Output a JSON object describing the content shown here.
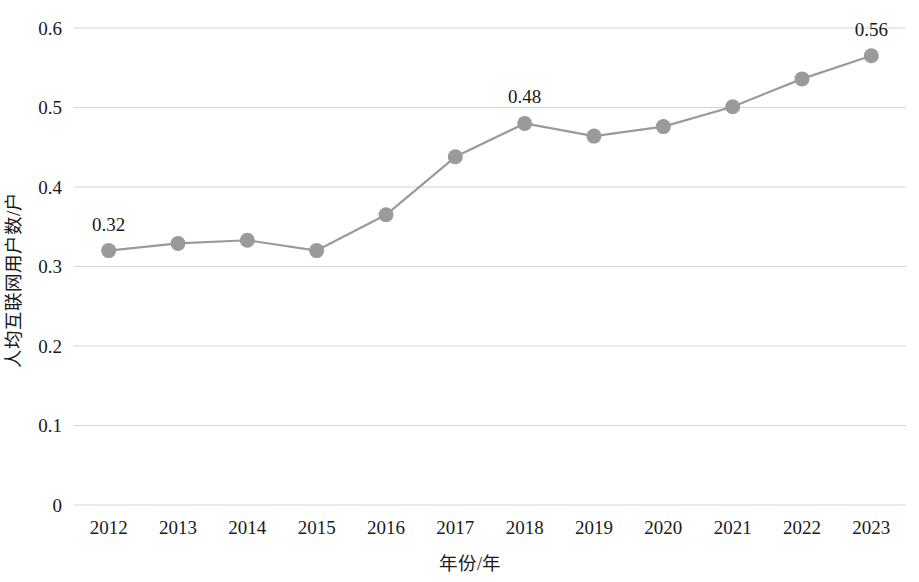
{
  "chart_data": {
    "type": "line",
    "title": "",
    "xlabel": "年份/年",
    "ylabel": "人均互联网用户数/户",
    "categories": [
      "2012",
      "2013",
      "2014",
      "2015",
      "2016",
      "2017",
      "2018",
      "2019",
      "2020",
      "2021",
      "2022",
      "2023"
    ],
    "values": [
      0.32,
      0.329,
      0.333,
      0.32,
      0.365,
      0.438,
      0.48,
      0.464,
      0.476,
      0.501,
      0.536,
      0.565
    ],
    "series": [
      {
        "name": "人均互联网用户数",
        "values": [
          0.32,
          0.329,
          0.333,
          0.32,
          0.365,
          0.438,
          0.48,
          0.464,
          0.476,
          0.501,
          0.536,
          0.565
        ]
      }
    ],
    "point_labels": [
      {
        "index": 0,
        "text": "0.32"
      },
      {
        "index": 6,
        "text": "0.48"
      },
      {
        "index": 11,
        "text": "0.56"
      }
    ],
    "ylim": [
      0,
      0.6
    ],
    "yticks": [
      0,
      0.1,
      0.2,
      0.3,
      0.4,
      0.5,
      0.6
    ],
    "ytick_labels": [
      "0",
      "0.1",
      "0.2",
      "0.3",
      "0.4",
      "0.5",
      "0.6"
    ],
    "grid": true,
    "legend": null,
    "colors": {
      "line": "#9a9a9a",
      "marker": "#9a9a9a",
      "gridline": "#d4d4d4",
      "text": "#1a1a1a",
      "background": "#ffffff"
    }
  }
}
